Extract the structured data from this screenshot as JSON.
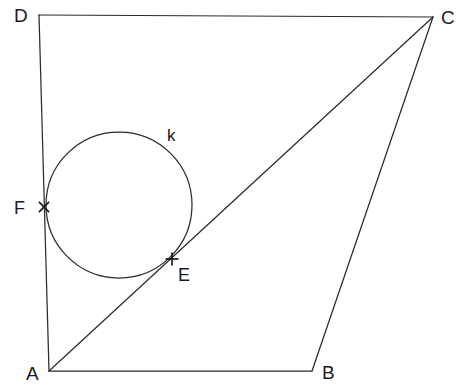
{
  "figure": {
    "background_color": "#ffffff",
    "stroke_color": "#2b2b2b",
    "label_color": "#1a1a1a",
    "width": 468,
    "height": 392
  },
  "vertices": {
    "d": {
      "label": "D",
      "x": 39,
      "y": 15,
      "label_x": 14,
      "label_y": 22
    },
    "c": {
      "label": "C",
      "x": 433,
      "y": 17,
      "label_x": 441,
      "label_y": 24
    },
    "a": {
      "label": "A",
      "x": 49,
      "y": 371,
      "label_x": 26,
      "label_y": 380
    },
    "b": {
      "label": "B",
      "x": 312,
      "y": 371,
      "label_x": 322,
      "label_y": 379
    }
  },
  "points": {
    "e": {
      "label": "E",
      "x": 172,
      "y": 259,
      "label_x": 178,
      "label_y": 281,
      "marker": "plus-marker"
    },
    "f": {
      "label": "F",
      "x": 44,
      "y": 207,
      "label_x": 14,
      "label_y": 214,
      "marker": "cross-marker"
    }
  },
  "circle": {
    "label": "k",
    "center_x": 119,
    "center_y": 205,
    "radius": 73,
    "label_x": 167,
    "label_y": 141
  },
  "edges": [
    {
      "name": "edge-dc",
      "from": "d",
      "to": "c"
    },
    {
      "name": "edge-cb",
      "from": "c",
      "to": "b"
    },
    {
      "name": "edge-ba",
      "from": "b",
      "to": "a"
    },
    {
      "name": "edge-ad",
      "from": "a",
      "to": "d"
    },
    {
      "name": "diagonal-ac",
      "from": "a",
      "to": "c"
    }
  ]
}
